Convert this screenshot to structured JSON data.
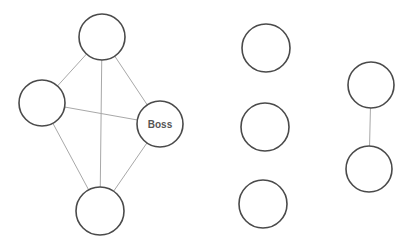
{
  "diagram": {
    "title": "",
    "nodes": [
      {
        "id": "n1",
        "label": "",
        "cx": 102,
        "cy": 37,
        "r": 23
      },
      {
        "id": "n2",
        "label": "",
        "cx": 42,
        "cy": 103,
        "r": 23
      },
      {
        "id": "n3",
        "label": "Boss",
        "cx": 160,
        "cy": 124,
        "r": 23
      },
      {
        "id": "n4",
        "label": "",
        "cx": 100,
        "cy": 211,
        "r": 24
      },
      {
        "id": "n5",
        "label": "",
        "cx": 266,
        "cy": 48,
        "r": 24
      },
      {
        "id": "n6",
        "label": "",
        "cx": 265,
        "cy": 127,
        "r": 24
      },
      {
        "id": "n7",
        "label": "",
        "cx": 263,
        "cy": 204,
        "r": 24
      },
      {
        "id": "n8",
        "label": "",
        "cx": 371,
        "cy": 85,
        "r": 23
      },
      {
        "id": "n9",
        "label": "",
        "cx": 369,
        "cy": 169,
        "r": 23
      }
    ],
    "edges": [
      {
        "from": "n1",
        "to": "n2"
      },
      {
        "from": "n1",
        "to": "n3"
      },
      {
        "from": "n1",
        "to": "n4"
      },
      {
        "from": "n2",
        "to": "n3"
      },
      {
        "from": "n2",
        "to": "n4"
      },
      {
        "from": "n3",
        "to": "n4"
      },
      {
        "from": "n8",
        "to": "n9"
      }
    ],
    "colors": {
      "node_stroke": "#4a4a4a",
      "edge_stroke": "#a8a8a8",
      "label_text": "#555555",
      "background": "#ffffff"
    }
  }
}
